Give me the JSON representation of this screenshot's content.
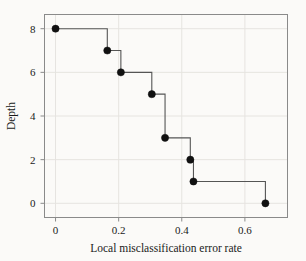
{
  "figure": {
    "background_color": "#fbfaf8",
    "frame_color": "#8a8a8a",
    "grid_color": "#e6e4e0",
    "marker_color": "#111111",
    "line_color": "#555555"
  },
  "chart_data": {
    "type": "line",
    "subtype": "step-post",
    "title": "",
    "xlabel": "Local misclassification error rate",
    "ylabel": "Depth",
    "xlim": [
      -0.035,
      0.735
    ],
    "ylim": [
      -0.65,
      8.65
    ],
    "xticks": [
      0,
      0.2,
      0.4,
      0.6
    ],
    "xticklabels": [
      "0",
      "0.2",
      "0.4",
      "0.6"
    ],
    "yticks": [
      0,
      2,
      4,
      6,
      8
    ],
    "yticklabels": [
      "0",
      "2",
      "4",
      "6",
      "8"
    ],
    "grid": true,
    "legend": null,
    "marker": "filled-circle",
    "x": [
      0,
      0.164,
      0.207,
      0.305,
      0.347,
      0.427,
      0.437,
      0.665
    ],
    "y": [
      8,
      7,
      6,
      5,
      3,
      2,
      1,
      0
    ],
    "points": [
      {
        "x": 0,
        "y": 8
      },
      {
        "x": 0.164,
        "y": 7
      },
      {
        "x": 0.207,
        "y": 6
      },
      {
        "x": 0.305,
        "y": 5
      },
      {
        "x": 0.347,
        "y": 3
      },
      {
        "x": 0.427,
        "y": 2
      },
      {
        "x": 0.437,
        "y": 1
      },
      {
        "x": 0.665,
        "y": 0
      }
    ]
  }
}
